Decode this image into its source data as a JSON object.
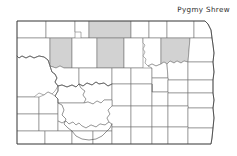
{
  "map": {
    "title": "Pygmy Shrew",
    "region": "North Dakota",
    "type": "species-distribution-county-map",
    "colors": {
      "occupied_fill": "#d2d2d2",
      "unoccupied_fill": "#ffffff",
      "county_line": "#6e6e6e",
      "state_outline": "#3a3a3a",
      "river_line": "#4a4a4a",
      "title_text": "#2b2b2b",
      "background": "#ffffff"
    },
    "legend": {
      "occupied_meaning": "county with recorded occurrence",
      "unoccupied_meaning": "county with no recorded occurrence"
    },
    "counts": {
      "occupied_counties": 4,
      "total_counties_drawn": 53
    },
    "occupied_counties": [
      "Mountrail",
      "Bottineau",
      "McHenry",
      "Ramsey"
    ],
    "counties": [
      {
        "name": "Divide",
        "occupied": false,
        "row": 1,
        "col": 1
      },
      {
        "name": "Burke",
        "occupied": false,
        "row": 1,
        "col": 2
      },
      {
        "name": "Renville",
        "occupied": false,
        "row": 1,
        "col": 3
      },
      {
        "name": "Bottineau",
        "occupied": true,
        "row": 1,
        "col": 4
      },
      {
        "name": "Rolette",
        "occupied": false,
        "row": 1,
        "col": 5
      },
      {
        "name": "Towner",
        "occupied": false,
        "row": 1,
        "col": 6
      },
      {
        "name": "Cavalier",
        "occupied": false,
        "row": 1,
        "col": 7
      },
      {
        "name": "Pembina",
        "occupied": false,
        "row": 1,
        "col": 8
      },
      {
        "name": "Williams",
        "occupied": false,
        "row": 2,
        "col": 1
      },
      {
        "name": "Mountrail",
        "occupied": true,
        "row": 2,
        "col": 2
      },
      {
        "name": "Ward",
        "occupied": false,
        "row": 2,
        "col": 3
      },
      {
        "name": "McHenry",
        "occupied": true,
        "row": 2,
        "col": 4
      },
      {
        "name": "Pierce",
        "occupied": false,
        "row": 2,
        "col": 5
      },
      {
        "name": "Benson",
        "occupied": false,
        "row": 2,
        "col": 6
      },
      {
        "name": "Ramsey",
        "occupied": true,
        "row": 2,
        "col": 7
      },
      {
        "name": "Walsh",
        "occupied": false,
        "row": 2,
        "col": 8
      },
      {
        "name": "McKenzie",
        "occupied": false,
        "row": 3,
        "col": 1
      },
      {
        "name": "Dunn",
        "occupied": false,
        "row": 3,
        "col": 2
      },
      {
        "name": "McLean",
        "occupied": false,
        "row": 3,
        "col": 3
      },
      {
        "name": "Sheridan",
        "occupied": false,
        "row": 3,
        "col": 4
      },
      {
        "name": "Wells",
        "occupied": false,
        "row": 3,
        "col": 5
      },
      {
        "name": "Eddy",
        "occupied": false,
        "row": 3,
        "col": 6
      },
      {
        "name": "Nelson",
        "occupied": false,
        "row": 3,
        "col": 7
      },
      {
        "name": "Grand Forks",
        "occupied": false,
        "row": 3,
        "col": 8
      },
      {
        "name": "Golden Valley",
        "occupied": false,
        "row": 4,
        "col": 1
      },
      {
        "name": "Billings",
        "occupied": false,
        "row": 4,
        "col": 2
      },
      {
        "name": "Mercer",
        "occupied": false,
        "row": 4,
        "col": 3
      },
      {
        "name": "Oliver",
        "occupied": false,
        "row": 4,
        "col": 4
      },
      {
        "name": "Burleigh",
        "occupied": false,
        "row": 4,
        "col": 5
      },
      {
        "name": "Kidder",
        "occupied": false,
        "row": 4,
        "col": 6
      },
      {
        "name": "Stutsman",
        "occupied": false,
        "row": 4,
        "col": 7
      },
      {
        "name": "Barnes",
        "occupied": false,
        "row": 4,
        "col": 8
      },
      {
        "name": "Cass",
        "occupied": false,
        "row": 4,
        "col": 9
      },
      {
        "name": "Slope",
        "occupied": false,
        "row": 5,
        "col": 1
      },
      {
        "name": "Stark",
        "occupied": false,
        "row": 5,
        "col": 2
      },
      {
        "name": "Morton",
        "occupied": false,
        "row": 5,
        "col": 3
      },
      {
        "name": "Grant",
        "occupied": false,
        "row": 5,
        "col": 4
      },
      {
        "name": "Emmons",
        "occupied": false,
        "row": 5,
        "col": 5
      },
      {
        "name": "Logan",
        "occupied": false,
        "row": 5,
        "col": 6
      },
      {
        "name": "LaMoure",
        "occupied": false,
        "row": 5,
        "col": 7
      },
      {
        "name": "Ransom",
        "occupied": false,
        "row": 5,
        "col": 8
      },
      {
        "name": "Richland",
        "occupied": false,
        "row": 5,
        "col": 9
      },
      {
        "name": "Bowman",
        "occupied": false,
        "row": 6,
        "col": 1
      },
      {
        "name": "Adams",
        "occupied": false,
        "row": 6,
        "col": 2
      },
      {
        "name": "Hettinger",
        "occupied": false,
        "row": 6,
        "col": 3
      },
      {
        "name": "Sioux",
        "occupied": false,
        "row": 6,
        "col": 4
      },
      {
        "name": "McIntosh",
        "occupied": false,
        "row": 6,
        "col": 5
      },
      {
        "name": "Dickey",
        "occupied": false,
        "row": 6,
        "col": 6
      },
      {
        "name": "Sargent",
        "occupied": false,
        "row": 6,
        "col": 7
      },
      {
        "name": "Griggs",
        "occupied": false,
        "row": 3,
        "col": 10
      },
      {
        "name": "Steele",
        "occupied": false,
        "row": 4,
        "col": 10
      },
      {
        "name": "Traill",
        "occupied": false,
        "row": 4,
        "col": 11
      },
      {
        "name": "Foster",
        "occupied": false,
        "row": 3,
        "col": 11
      }
    ]
  }
}
